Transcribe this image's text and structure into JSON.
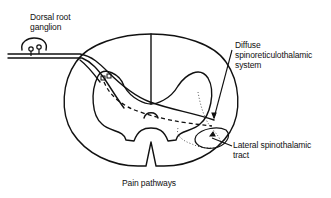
{
  "diagram": {
    "caption": "Pain pathways",
    "labels": {
      "dorsal_root_ganglion": [
        "Dorsal root",
        "ganglion"
      ],
      "diffuse_system": [
        "Diffuse",
        "spinoreticulothalamic",
        "system"
      ],
      "lateral_tract": [
        "Lateral spinothalamic",
        "tract"
      ]
    },
    "colors": {
      "stroke": "#111111",
      "background": "#ffffff"
    }
  }
}
